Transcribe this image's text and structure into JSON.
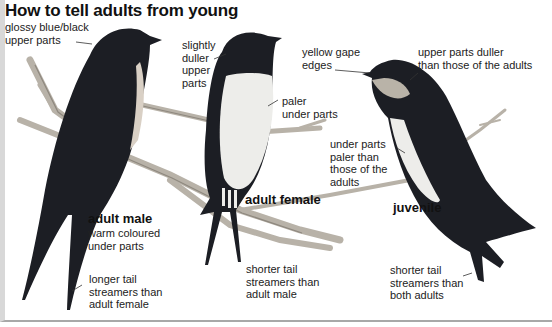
{
  "title": "How to tell adults from young",
  "birds": {
    "adult_male": {
      "name": "adult male",
      "notes": {
        "upper_parts": "glossy blue/black\nupper parts",
        "under_parts": "warm coloured\nunder parts",
        "tail": "longer tail\nstreamers than\nadult female"
      }
    },
    "adult_female": {
      "name": "adult female",
      "notes": {
        "upper_parts": "slightly\nduller\nupper\nparts",
        "under_parts": "paler\nunder parts",
        "tail": "shorter tail\nstreamers than\nadult male"
      }
    },
    "juvenile": {
      "name": "juvenile",
      "notes": {
        "gape": "yellow gape\nedges",
        "upper_parts": "upper parts duller\nthan those of the adults",
        "under_parts": "under parts\npaler than\nthose of the\nadults",
        "tail": "shorter tail\nstreamers than\nboth adults"
      }
    }
  },
  "colors": {
    "plumage_dark": "#1c1e24",
    "underparts_light": "#ededea",
    "throat_juvenile": "#b9b3a8",
    "branch": "#b8b2a8"
  }
}
